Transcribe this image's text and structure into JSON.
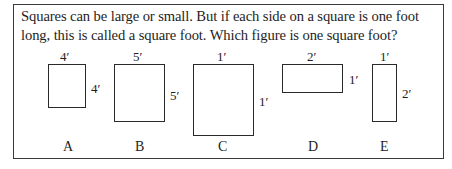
{
  "question": {
    "text": "Squares can be large or small. But if each side on a square is one foot long, this is called a square foot. Which figure is one square foot?"
  },
  "figures": [
    {
      "letter": "A",
      "top_label": "4′",
      "side_label": "4′"
    },
    {
      "letter": "B",
      "top_label": "5′",
      "side_label": "5′"
    },
    {
      "letter": "C",
      "top_label": "1′",
      "side_label": "1′"
    },
    {
      "letter": "D",
      "top_label": "2′",
      "side_label": "1′"
    },
    {
      "letter": "E",
      "top_label": "1′",
      "side_label": "2′"
    }
  ]
}
